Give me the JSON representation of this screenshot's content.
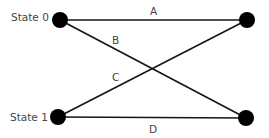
{
  "diagram": {
    "type": "state-transition",
    "states": [
      {
        "id": "s0",
        "label": "State 0"
      },
      {
        "id": "s1",
        "label": "State 1"
      }
    ],
    "edges": [
      {
        "id": "A",
        "label": "A",
        "from": "State 0",
        "to": "State 0 (next)"
      },
      {
        "id": "B",
        "label": "B",
        "from": "State 0",
        "to": "State 1 (next)"
      },
      {
        "id": "C",
        "label": "C",
        "from": "State 1",
        "to": "State 0 (next)"
      },
      {
        "id": "D",
        "label": "D",
        "from": "State 1",
        "to": "State 1 (next)"
      }
    ]
  },
  "colors": {
    "node": "#000000",
    "edge": "#151515",
    "text": "#444444"
  }
}
